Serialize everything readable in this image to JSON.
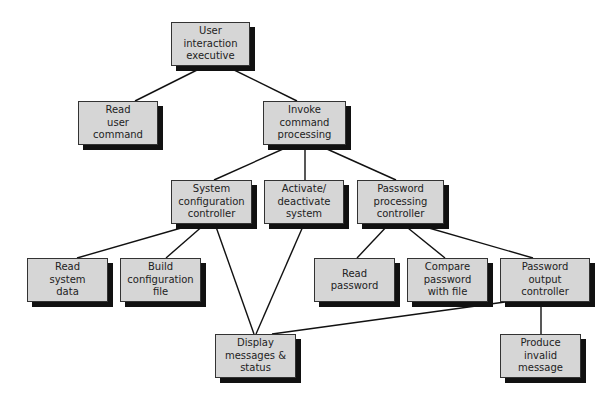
{
  "diagram": {
    "type": "hierarchy-chart",
    "nodes": [
      {
        "id": "uie",
        "lines": [
          "User",
          "interaction",
          "executive"
        ],
        "x": 171,
        "y": 22,
        "w": 79,
        "h": 44
      },
      {
        "id": "ruc",
        "lines": [
          "Read",
          "user",
          "command"
        ],
        "x": 78,
        "y": 101,
        "w": 80,
        "h": 44
      },
      {
        "id": "icp",
        "lines": [
          "Invoke",
          "command",
          "processing"
        ],
        "x": 263,
        "y": 101,
        "w": 83,
        "h": 44
      },
      {
        "id": "scc",
        "lines": [
          "System",
          "configuration",
          "controller"
        ],
        "x": 171,
        "y": 180,
        "w": 81,
        "h": 44
      },
      {
        "id": "ads",
        "lines": [
          "Activate/",
          "deactivate",
          "system"
        ],
        "x": 264,
        "y": 180,
        "w": 80,
        "h": 44
      },
      {
        "id": "ppc",
        "lines": [
          "Password",
          "processing",
          "controller"
        ],
        "x": 357,
        "y": 180,
        "w": 87,
        "h": 44
      },
      {
        "id": "rsd",
        "lines": [
          "Read",
          "system",
          "data"
        ],
        "x": 27,
        "y": 258,
        "w": 81,
        "h": 44
      },
      {
        "id": "bcf",
        "lines": [
          "Build",
          "configuration",
          "file"
        ],
        "x": 120,
        "y": 258,
        "w": 81,
        "h": 44
      },
      {
        "id": "rp",
        "lines": [
          "Read",
          "password"
        ],
        "x": 314,
        "y": 258,
        "w": 81,
        "h": 44
      },
      {
        "id": "cpf",
        "lines": [
          "Compare",
          "password",
          "with file"
        ],
        "x": 407,
        "y": 258,
        "w": 81,
        "h": 44
      },
      {
        "id": "poc",
        "lines": [
          "Password",
          "output",
          "controller"
        ],
        "x": 500,
        "y": 258,
        "w": 90,
        "h": 44
      },
      {
        "id": "dms",
        "lines": [
          "Display",
          "messages &",
          "status"
        ],
        "x": 215,
        "y": 334,
        "w": 81,
        "h": 44
      },
      {
        "id": "pim",
        "lines": [
          "Produce",
          "invalid",
          "message"
        ],
        "x": 500,
        "y": 334,
        "w": 81,
        "h": 44
      }
    ],
    "edges": [
      {
        "from": "uie",
        "to": "ruc",
        "x1": 205,
        "y1": 66,
        "x2": 135,
        "y2": 101
      },
      {
        "from": "uie",
        "to": "icp",
        "x1": 226,
        "y1": 66,
        "x2": 297,
        "y2": 101
      },
      {
        "from": "icp",
        "to": "scc",
        "x1": 292,
        "y1": 145,
        "x2": 214,
        "y2": 180
      },
      {
        "from": "icp",
        "to": "ads",
        "x1": 305,
        "y1": 145,
        "x2": 305,
        "y2": 180
      },
      {
        "from": "icp",
        "to": "ppc",
        "x1": 318,
        "y1": 145,
        "x2": 396,
        "y2": 180
      },
      {
        "from": "scc",
        "to": "rsd",
        "x1": 195,
        "y1": 224,
        "x2": 77,
        "y2": 258
      },
      {
        "from": "scc",
        "to": "bcf",
        "x1": 205,
        "y1": 224,
        "x2": 166,
        "y2": 258
      },
      {
        "from": "scc",
        "to": "dms",
        "x1": 215,
        "y1": 224,
        "x2": 254,
        "y2": 334
      },
      {
        "from": "ads",
        "to": "dms",
        "x1": 304,
        "y1": 224,
        "x2": 256,
        "y2": 334
      },
      {
        "from": "ppc",
        "to": "rp",
        "x1": 389,
        "y1": 224,
        "x2": 357,
        "y2": 258
      },
      {
        "from": "ppc",
        "to": "cpf",
        "x1": 403,
        "y1": 224,
        "x2": 445,
        "y2": 258
      },
      {
        "from": "ppc",
        "to": "poc",
        "x1": 415,
        "y1": 224,
        "x2": 533,
        "y2": 258
      },
      {
        "from": "poc",
        "to": "dms",
        "x1": 505,
        "y1": 302,
        "x2": 272,
        "y2": 334
      },
      {
        "from": "poc",
        "to": "pim",
        "x1": 541,
        "y1": 302,
        "x2": 541,
        "y2": 334
      }
    ],
    "colors": {
      "box_fill": "#d6d6d6",
      "box_border": "#333333",
      "shadow": "#111111",
      "line": "#111111",
      "text": "#222222"
    }
  }
}
